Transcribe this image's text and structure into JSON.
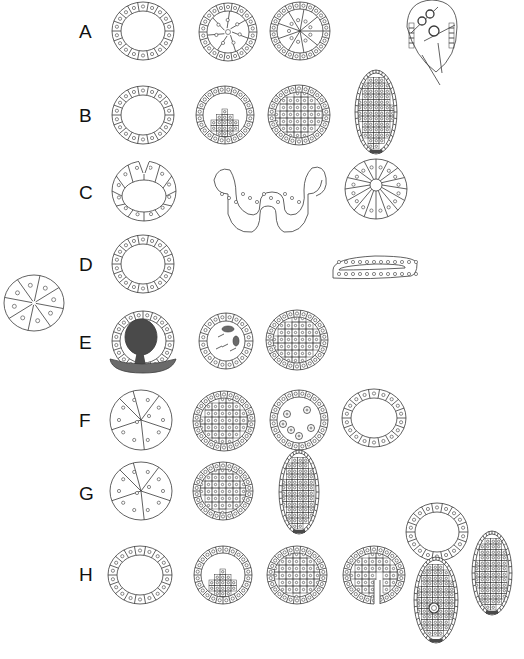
{
  "figure": {
    "type": "embryo-developmental-stages-diagram",
    "row_labels": [
      "A",
      "B",
      "C",
      "D",
      "E",
      "F",
      "G",
      "H"
    ],
    "rows": [
      {
        "label": "A",
        "y": 32,
        "stages": [
          {
            "kind": "blastula-hollow",
            "cx": 143,
            "cy": 31,
            "rx": 31,
            "ry": 29
          },
          {
            "kind": "blastula-ingressing",
            "cx": 228,
            "cy": 32,
            "rx": 29,
            "ry": 29
          },
          {
            "kind": "blastula-filled-radial",
            "cx": 300,
            "cy": 31,
            "rx": 30,
            "ry": 29
          },
          {
            "kind": "larva-pointed",
            "cx": 432,
            "cy": 45,
            "rx": 25,
            "ry": 45
          }
        ]
      },
      {
        "label": "B",
        "y": 116,
        "stages": [
          {
            "kind": "blastula-hollow",
            "cx": 143,
            "cy": 115,
            "rx": 31,
            "ry": 29
          },
          {
            "kind": "blastula-invaginating",
            "cx": 225,
            "cy": 115,
            "rx": 29,
            "ry": 29
          },
          {
            "kind": "morula-solid",
            "cx": 299,
            "cy": 115,
            "rx": 31,
            "ry": 30
          },
          {
            "kind": "larva-oval",
            "cx": 376,
            "cy": 112,
            "rx": 21,
            "ry": 42
          }
        ]
      },
      {
        "label": "C",
        "y": 193,
        "stages": [
          {
            "kind": "blastula-large-cells",
            "cx": 144,
            "cy": 191,
            "rx": 32,
            "ry": 30
          },
          {
            "kind": "gastrula-w-shaped",
            "cx": 260,
            "cy": 194,
            "rx": 50,
            "ry": 26
          },
          {
            "kind": "embryo-radial-cleavage",
            "cx": 376,
            "cy": 189,
            "rx": 31,
            "ry": 30
          }
        ]
      },
      {
        "label": "D",
        "y": 265,
        "stages": [
          {
            "kind": "blastula-hollow",
            "cx": 143,
            "cy": 264,
            "rx": 31,
            "ry": 29
          },
          {
            "kind": "flat-elongated",
            "cx": 375,
            "cy": 270,
            "rx": 42,
            "ry": 14
          }
        ]
      },
      {
        "label": "E",
        "y": 343,
        "stages": [
          {
            "kind": "blastula-dark-mass",
            "cx": 143,
            "cy": 341,
            "rx": 31,
            "ry": 30
          },
          {
            "kind": "blastula-scattered",
            "cx": 226,
            "cy": 341,
            "rx": 27,
            "ry": 28
          },
          {
            "kind": "morula-solid",
            "cx": 297,
            "cy": 340,
            "rx": 31,
            "ry": 30
          }
        ]
      },
      {
        "label": "F",
        "y": 421,
        "stages": [
          {
            "kind": "morula-large-cells",
            "cx": 141,
            "cy": 420,
            "rx": 31,
            "ry": 30
          },
          {
            "kind": "morula-solid",
            "cx": 224,
            "cy": 421,
            "rx": 31,
            "ry": 30
          },
          {
            "kind": "morula-cavitating",
            "cx": 299,
            "cy": 420,
            "rx": 29,
            "ry": 30
          },
          {
            "kind": "blastula-hollow",
            "cx": 374,
            "cy": 418,
            "rx": 32,
            "ry": 29
          }
        ]
      },
      {
        "label": "G",
        "y": 494,
        "stages": [
          {
            "kind": "morula-large-cells",
            "cx": 141,
            "cy": 491,
            "rx": 31,
            "ry": 29
          },
          {
            "kind": "morula-solid",
            "cx": 223,
            "cy": 491,
            "rx": 30,
            "ry": 29
          },
          {
            "kind": "larva-oval",
            "cx": 299,
            "cy": 492,
            "rx": 20,
            "ry": 42
          }
        ]
      },
      {
        "label": "H",
        "y": 575,
        "stages": [
          {
            "kind": "blastula-hollow",
            "cx": 140,
            "cy": 575,
            "rx": 32,
            "ry": 29
          },
          {
            "kind": "blastula-invaginating",
            "cx": 223,
            "cy": 575,
            "rx": 29,
            "ry": 29
          },
          {
            "kind": "morula-solid",
            "cx": 297,
            "cy": 575,
            "rx": 30,
            "ry": 29
          },
          {
            "kind": "morula-cleft",
            "cx": 374,
            "cy": 575,
            "rx": 31,
            "ry": 29
          },
          {
            "kind": "blastula-hollow",
            "cx": 437,
            "cy": 532,
            "rx": 31,
            "ry": 29
          },
          {
            "kind": "larva-oval-pore",
            "cx": 436,
            "cy": 600,
            "rx": 22,
            "ry": 43
          },
          {
            "kind": "larva-oval",
            "cx": 492,
            "cy": 573,
            "rx": 20,
            "ry": 42
          }
        ]
      }
    ],
    "standalone": [
      {
        "kind": "embryo-8-cell-radial",
        "cx": 34,
        "cy": 303,
        "rx": 30,
        "ry": 28
      }
    ],
    "colors": {
      "stroke": "#3a3a3a",
      "dark_fill": "#4a4a4a",
      "dark_fill_2": "#6a6a6a",
      "background": "#ffffff"
    }
  }
}
